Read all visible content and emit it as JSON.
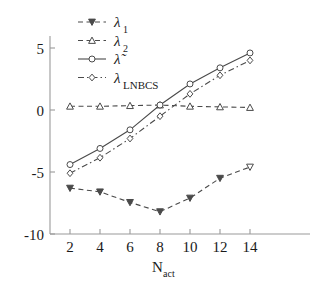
{
  "chart_data": {
    "type": "line",
    "title": "",
    "xlabel": "N_act",
    "xlabel_main": "N",
    "xlabel_sub": "act",
    "ylabel": "",
    "x": [
      2,
      4,
      6,
      8,
      10,
      12,
      14
    ],
    "xticks": [
      "2",
      "4",
      "6",
      "8",
      "10",
      "12",
      "14"
    ],
    "yticks": [
      "5",
      "0",
      "-5",
      "-10"
    ],
    "ytick_values": [
      5,
      0,
      -5,
      -10
    ],
    "xlim": [
      1,
      15.4
    ],
    "ylim": [
      -10,
      6.6
    ],
    "grid": false,
    "legend_position": "top-left",
    "series": [
      {
        "name": "lambda_1",
        "label_main": "λ",
        "label_sub": "1",
        "marker": "triangle-down",
        "linestyle": "dashed",
        "color": "#4a4a4a",
        "values": [
          -6.3,
          -6.6,
          -7.45,
          -8.2,
          -7.1,
          -5.5,
          -4.6
        ],
        "filled": [
          true,
          true,
          true,
          true,
          true,
          true,
          false
        ]
      },
      {
        "name": "lambda_2",
        "label_main": "λ",
        "label_sub": "2",
        "marker": "triangle-up",
        "linestyle": "dashed",
        "color": "#4a4a4a",
        "values": [
          0.3,
          0.3,
          0.35,
          0.4,
          0.3,
          0.25,
          0.2
        ],
        "filled": [
          false,
          false,
          false,
          false,
          false,
          false,
          false
        ]
      },
      {
        "name": "lambda_tilde",
        "label_main": "λ̃",
        "label_sub": "",
        "marker": "circle",
        "linestyle": "solid",
        "color": "#4a4a4a",
        "values": [
          -4.4,
          -3.1,
          -1.6,
          0.4,
          2.1,
          3.4,
          4.6
        ],
        "filled": [
          false,
          false,
          false,
          false,
          false,
          false,
          false
        ]
      },
      {
        "name": "lambda_LNBCS",
        "label_main": "λ",
        "label_sub": "LNBCS",
        "marker": "diamond",
        "linestyle": "dashdot",
        "color": "#4a4a4a",
        "values": [
          -5.1,
          -3.85,
          -2.3,
          -0.5,
          1.3,
          2.8,
          4.0
        ],
        "filled": [
          false,
          false,
          false,
          false,
          false,
          false,
          false
        ]
      }
    ]
  }
}
